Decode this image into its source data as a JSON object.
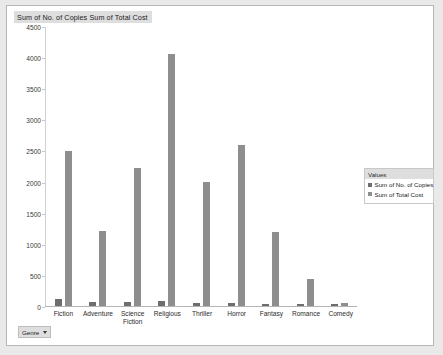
{
  "chart_data": {
    "type": "bar",
    "title": "Sum of No. of Copies  Sum of Total Cost",
    "xlabel": "",
    "ylabel": "",
    "ylim": [
      0,
      4500
    ],
    "yticks": [
      0,
      500,
      1000,
      1500,
      2000,
      2500,
      3000,
      3500,
      4000,
      4500
    ],
    "grid": false,
    "legend_position": "right",
    "legend_title": "Values",
    "categories": [
      "Fiction",
      "Adventure",
      "Science Fiction",
      "Religious",
      "Thriller",
      "Horror",
      "Fantasy",
      "Romance",
      "Comedy"
    ],
    "series": [
      {
        "name": "Sum of No. of Copies",
        "color": "#6e6e6e",
        "values": [
          115,
          70,
          65,
          80,
          55,
          45,
          40,
          40,
          25
        ]
      },
      {
        "name": "Sum of Total Cost",
        "color": "#8e8e8e",
        "values": [
          2500,
          1210,
          2230,
          4060,
          2000,
          2600,
          1200,
          430,
          45
        ]
      }
    ]
  },
  "field_button": {
    "label": "Genre",
    "caret_icon": "chevron-down-icon"
  }
}
